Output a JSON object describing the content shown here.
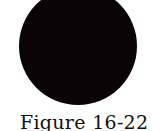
{
  "figure": {
    "shape": "filled-circle",
    "fill_color": "#0a0406",
    "background_color": "#fefefe",
    "caption": "Figure 16-22"
  }
}
